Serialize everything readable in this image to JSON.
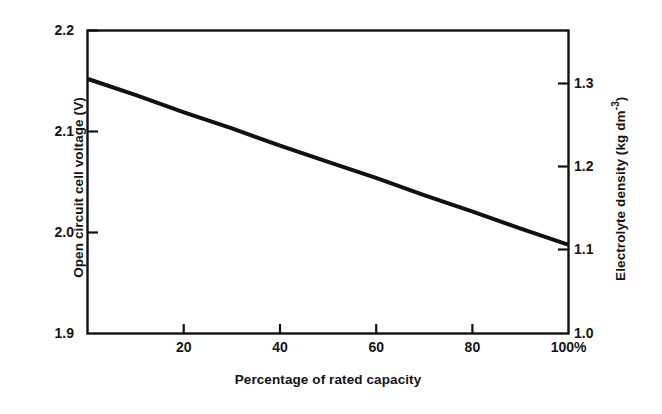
{
  "figure": {
    "background_color": "#ffffff",
    "line_color": "#111111",
    "axis_color": "#111111"
  },
  "chart_data": {
    "type": "line",
    "title": "",
    "subtitle": "",
    "xlabel": "Percentage of rated capacity",
    "ylabel": "Open circuit cell voltage (V)",
    "ylabel_right": "Electrolyte density (kg dm",
    "ylabel_right_sup": "-3",
    "ylabel_right_close": ")",
    "xlim": [
      0,
      100
    ],
    "ylim": [
      1.9,
      2.2
    ],
    "ylim_right": [
      1.0,
      1.3
    ],
    "grid": false,
    "legend": null,
    "x_ticks": [
      20,
      40,
      60,
      80,
      100
    ],
    "x_tick_labels": [
      "20",
      "40",
      "60",
      "80",
      "100%"
    ],
    "y_ticks_left": [
      1.9,
      2.0,
      2.1,
      2.2
    ],
    "y_tick_labels_left": [
      "1.9",
      "2.0",
      "2.1",
      "2.2"
    ],
    "y_ticks_right": [
      1.0,
      1.1,
      1.2,
      1.3
    ],
    "y_tick_labels_right": [
      "1.0",
      "1.1",
      "1.2",
      "1.3"
    ],
    "series": [
      {
        "name": "Open circuit cell voltage",
        "x": [
          0,
          10,
          20,
          30,
          40,
          50,
          60,
          70,
          80,
          90,
          100
        ],
        "values": [
          2.152,
          2.136,
          2.119,
          2.103,
          2.086,
          2.07,
          2.054,
          2.037,
          2.021,
          2.004,
          1.988
        ],
        "values_right_axis": [
          1.252,
          1.236,
          1.219,
          1.203,
          1.186,
          1.17,
          1.154,
          1.137,
          1.121,
          1.104,
          1.088
        ]
      }
    ],
    "annotations": []
  },
  "labels": {
    "y_left_title": "Open circuit cell voltage (V)",
    "y_right_title_main": "Electrolyte density (kg dm",
    "y_right_title_sup": "-3",
    "y_right_title_tail": ")",
    "x_title": "Percentage of rated capacity"
  }
}
